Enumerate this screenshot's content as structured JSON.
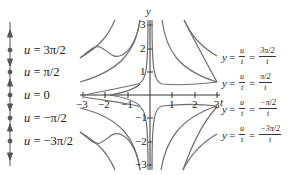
{
  "figure": {
    "colors": {
      "curve": "#6e6e6e",
      "axis": "#333333",
      "text": "#222222",
      "background": "#ffffff"
    }
  },
  "phase_line": {
    "equilibria": [
      {
        "label": "u = 3π/2",
        "var": "u",
        "rhs": "= 3π/2"
      },
      {
        "label": "u = π/2",
        "var": "u",
        "rhs": "= π/2"
      },
      {
        "label": "u = 0",
        "var": "u",
        "rhs": "= 0"
      },
      {
        "label": "u = −π/2",
        "var": "u",
        "rhs": "= −π/2"
      },
      {
        "label": "u = −3π/2",
        "var": "u",
        "rhs": "= −3π/2"
      }
    ],
    "arrows": [
      "up",
      "down",
      "up",
      "down",
      "up",
      "down"
    ]
  },
  "axes": {
    "x_label": "t",
    "y_label": "y",
    "x_ticks": [
      "−3",
      "−2",
      "−1",
      "1",
      "2",
      "3"
    ],
    "y_ticks": [
      "3",
      "2",
      "1",
      "−1",
      "−2",
      "−3"
    ]
  },
  "curve_labels": [
    {
      "lhs": "y",
      "eq1": "=",
      "frac1_num": "u",
      "frac1_den": "t",
      "eq2": "=",
      "frac2_num": "3π/2",
      "frac2_den": "t"
    },
    {
      "lhs": "y",
      "eq1": "=",
      "frac1_num": "u",
      "frac1_den": "t",
      "eq2": "=",
      "frac2_num": "π/2",
      "frac2_den": "t"
    },
    {
      "lhs": "y",
      "eq1": "=",
      "frac1_num": "u",
      "frac1_den": "t",
      "eq2": "=",
      "frac2_num": "−π/2",
      "frac2_den": "t"
    },
    {
      "lhs": "y",
      "eq1": "=",
      "frac1_num": "u",
      "frac1_den": "t",
      "eq2": "=",
      "frac2_num": "−3π/2",
      "frac2_den": "t"
    }
  ]
}
